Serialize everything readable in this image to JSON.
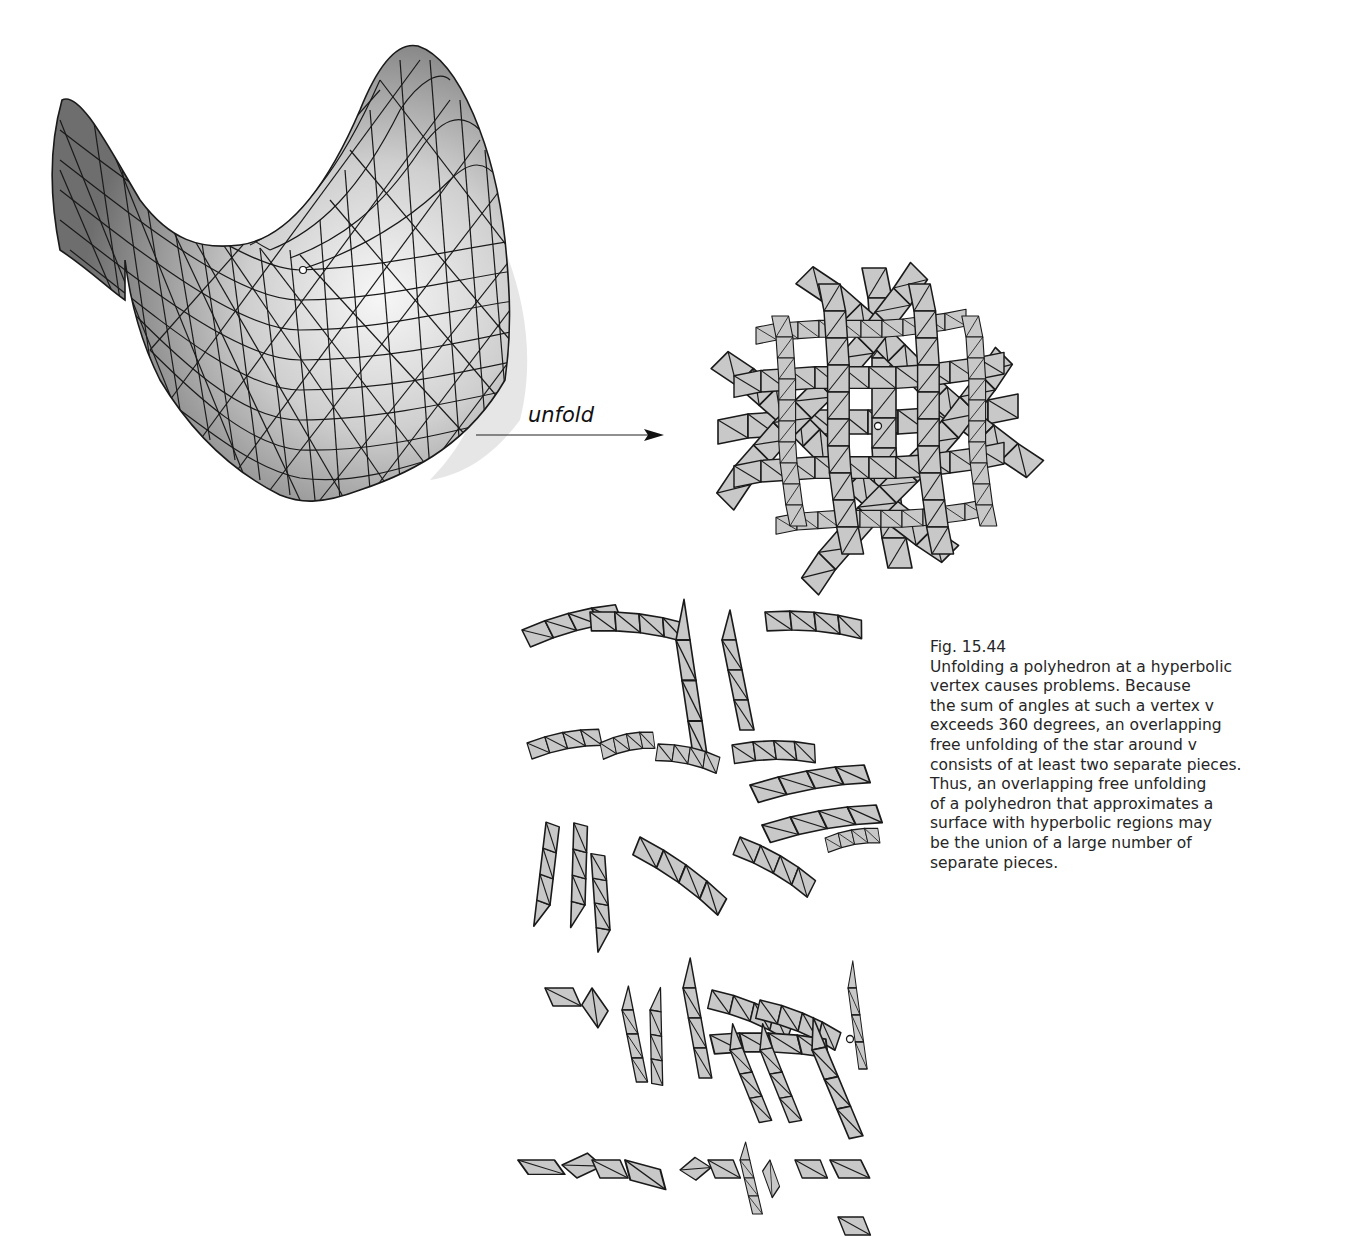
{
  "figure": {
    "number": "Fig. 15.44",
    "arrow_label": "unfold",
    "caption_lines": [
      "Unfolding a polyhedron at a hyperbolic",
      "vertex causes problems. Because",
      "the sum of angles at such a vertex v",
      "exceeds 360 degrees, an overlapping",
      "free unfolding of the star around v",
      "consists of at least two separate pieces.",
      "Thus, an overlapping free unfolding",
      "of a polyhedron that approximates a",
      "surface with hyperbolic regions may",
      "be the union of a large number of",
      "separate pieces."
    ],
    "panels": {
      "surface": "Triangulated saddle surface (hyperbolic paraboloid) with marked vertex v",
      "overlapping_unfolding": "Overlapping unfolding of triangle strips around vertex v",
      "separate_pieces": "Overlap-free unfolding split into many separate triangle-strip pieces"
    },
    "colors": {
      "face_fill": "#c8c8c8",
      "edge": "#1a1a1a",
      "background": "#ffffff"
    }
  }
}
